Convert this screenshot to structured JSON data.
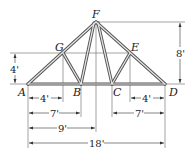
{
  "diagram": {
    "type": "roof truss",
    "joints": [
      {
        "id": "A",
        "label": "A",
        "x": 28,
        "y": 84,
        "lx": 18,
        "ly": 96
      },
      {
        "id": "B",
        "label": "B",
        "x": 81,
        "y": 84,
        "lx": 73,
        "ly": 96
      },
      {
        "id": "C",
        "label": "C",
        "x": 112,
        "y": 84,
        "lx": 113,
        "ly": 96
      },
      {
        "id": "D",
        "label": "D",
        "x": 165,
        "y": 84,
        "lx": 169,
        "ly": 96
      },
      {
        "id": "E",
        "label": "E",
        "x": 130,
        "y": 53,
        "lx": 131,
        "ly": 51
      },
      {
        "id": "F",
        "label": "F",
        "x": 96,
        "y": 22,
        "lx": 92,
        "ly": 18
      },
      {
        "id": "G",
        "label": "G",
        "x": 63,
        "y": 53,
        "lx": 55,
        "ly": 51
      }
    ],
    "members": [
      [
        "A",
        "F"
      ],
      [
        "F",
        "D"
      ],
      [
        "A",
        "D"
      ],
      [
        "G",
        "B"
      ],
      [
        "B",
        "F"
      ],
      [
        "F",
        "C"
      ],
      [
        "C",
        "E"
      ]
    ],
    "dimensions": {
      "height_total": "8'",
      "height_G": "4'",
      "AG_horizontal": "4'",
      "AB": "7'",
      "AF_horizontal": "9'",
      "AD": "18'",
      "CD": "7'",
      "ED_horizontal": "4'"
    }
  }
}
